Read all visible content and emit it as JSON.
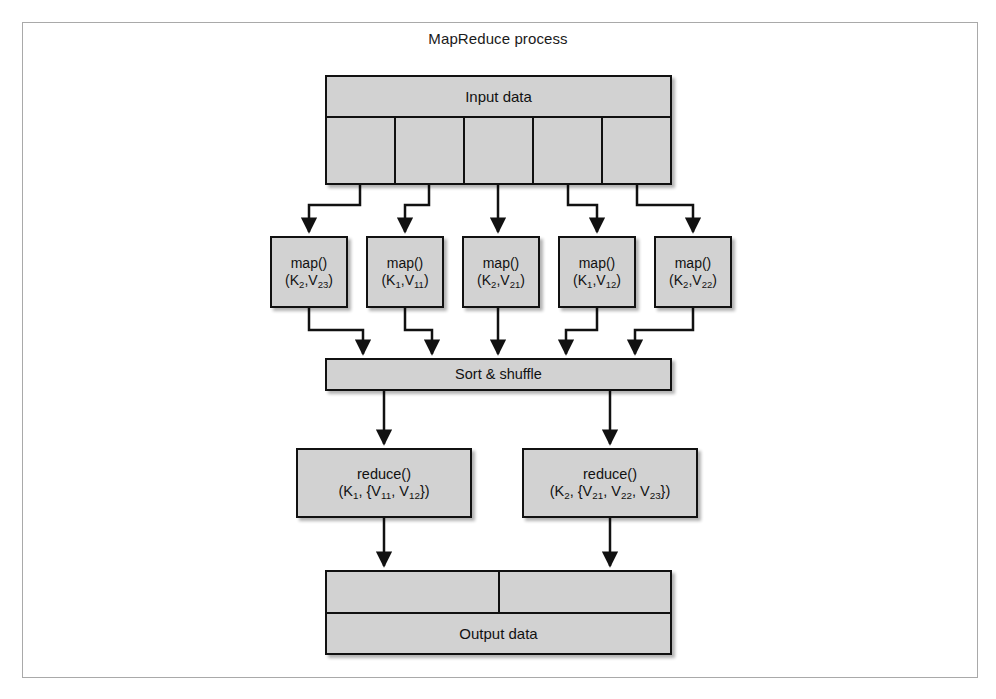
{
  "figure": {
    "title": "MapReduce process",
    "frame_border_color": "#a9a9a9",
    "node_fill_color": "#d2d2d2",
    "node_border_color": "#111111",
    "background_color": "#ffffff"
  },
  "input": {
    "label": "Input data",
    "split_count": 5,
    "cells": [
      "",
      "",
      "",
      "",
      ""
    ]
  },
  "map_stage": {
    "nodes": [
      {
        "fn": "map()",
        "args": "(K2,V23)",
        "key": "K",
        "key_sub": "2",
        "value": "V",
        "value_sub": "23"
      },
      {
        "fn": "map()",
        "args": "(K1,V11)",
        "key": "K",
        "key_sub": "1",
        "value": "V",
        "value_sub": "11"
      },
      {
        "fn": "map()",
        "args": "(K2,V21)",
        "key": "K",
        "key_sub": "2",
        "value": "V",
        "value_sub": "21"
      },
      {
        "fn": "map()",
        "args": "(K1,V12)",
        "key": "K",
        "key_sub": "1",
        "value": "V",
        "value_sub": "12"
      },
      {
        "fn": "map()",
        "args": "(K2,V22)",
        "key": "K",
        "key_sub": "2",
        "value": "V",
        "value_sub": "22"
      }
    ]
  },
  "sort_shuffle": {
    "label": "Sort & shuffle"
  },
  "reduce_stage": {
    "nodes": [
      {
        "fn": "reduce()",
        "args": "(K1, {V11, V12})",
        "key_sub": "1",
        "value_subs": [
          "11",
          "12"
        ]
      },
      {
        "fn": "reduce()",
        "args": "(K2, {V21, V22, V23})",
        "key_sub": "2",
        "value_subs": [
          "21",
          "22",
          "23"
        ]
      }
    ]
  },
  "output": {
    "label": "Output data",
    "split_count": 2,
    "cells": [
      "",
      ""
    ]
  }
}
